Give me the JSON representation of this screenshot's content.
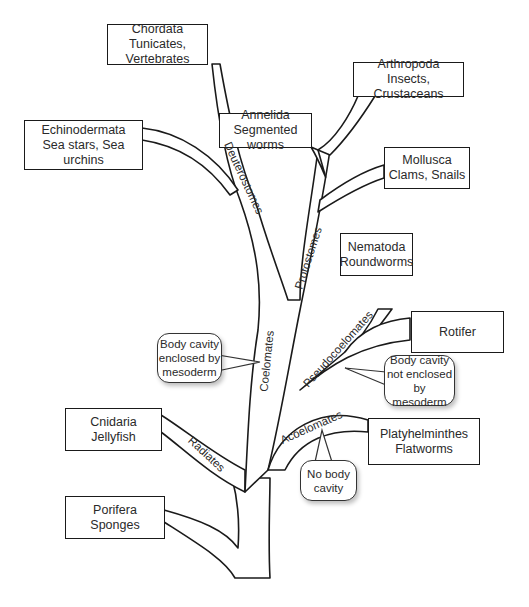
{
  "diagram": {
    "type": "phylogenetic-tree",
    "colors": {
      "stroke": "#1a1a1a",
      "fill": "#ffffff",
      "text": "#2a2a2a"
    }
  },
  "taxa": {
    "chordata": {
      "name": "Chordata",
      "examples": "Tunicates, Vertebrates"
    },
    "echinodermata": {
      "name": "Echinodermata",
      "examples": "Sea stars, Sea urchins"
    },
    "annelida": {
      "name": "Annelida",
      "examples": "Segmented worms"
    },
    "arthropoda": {
      "name": "Arthropoda",
      "examples": "Insects, Crustaceans"
    },
    "mollusca": {
      "name": "Mollusca",
      "examples": "Clams, Snails"
    },
    "nematoda": {
      "name": "Nematoda",
      "examples": "Roundworms"
    },
    "rotifer": {
      "name": "Rotifer",
      "examples": ""
    },
    "platyhelminthes": {
      "name": "Platyhelminthes",
      "examples": "Flatworms"
    },
    "cnidaria": {
      "name": "Cnidaria",
      "examples": "Jellyfish"
    },
    "porifera": {
      "name": "Porifera",
      "examples": "Sponges"
    }
  },
  "clades": {
    "deuterostomes": "Deuterostomes",
    "protostomes": "Protostomes",
    "coelomates": "Coelomates",
    "pseudocoelomates": "Pseudocoelomates",
    "acoelomates": "Acoelomates",
    "radiates": "Radiates"
  },
  "callouts": {
    "coelom": {
      "line1": "Body cavity",
      "line2": "enclosed by",
      "line3": "mesoderm"
    },
    "pseudocoelom": {
      "line1": "Body cavity",
      "line2": "not enclosed",
      "line3": "by mesoderm"
    },
    "acoelom": {
      "line1": "No body",
      "line2": "cavity"
    }
  }
}
